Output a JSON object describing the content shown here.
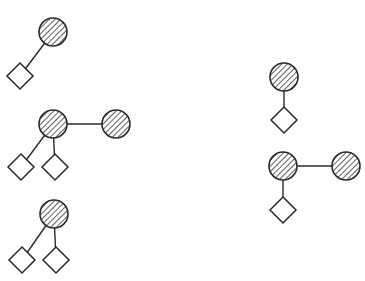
{
  "diagram": {
    "width": 365,
    "height": 281,
    "colors": {
      "stroke": "#2a2a2a",
      "background": "#ffffff",
      "diamond_fill": "#ffffff"
    },
    "node_styles": {
      "circle": {
        "shape": "circle",
        "fill": "hatched",
        "radius": 14
      },
      "diamond": {
        "shape": "diamond",
        "fill": "open",
        "half_diagonal": 13
      }
    },
    "motifs": [
      {
        "id": "motif-1",
        "nodes": [
          {
            "id": "c1",
            "type": "circle",
            "x": 53,
            "y": 32
          },
          {
            "id": "d1",
            "type": "diamond",
            "x": 20,
            "y": 76
          }
        ],
        "edges": [
          [
            "c1",
            "d1"
          ]
        ]
      },
      {
        "id": "motif-2",
        "nodes": [
          {
            "id": "c2",
            "type": "circle",
            "x": 53,
            "y": 124
          },
          {
            "id": "c3",
            "type": "circle",
            "x": 116,
            "y": 124
          },
          {
            "id": "d2",
            "type": "diamond",
            "x": 21,
            "y": 167
          },
          {
            "id": "d3",
            "type": "diamond",
            "x": 55,
            "y": 167
          }
        ],
        "edges": [
          [
            "c2",
            "c3"
          ],
          [
            "c2",
            "d2"
          ],
          [
            "c2",
            "d3"
          ]
        ]
      },
      {
        "id": "motif-3",
        "nodes": [
          {
            "id": "c4",
            "type": "circle",
            "x": 54,
            "y": 214
          },
          {
            "id": "d4",
            "type": "diamond",
            "x": 22,
            "y": 260
          },
          {
            "id": "d5",
            "type": "diamond",
            "x": 56,
            "y": 260
          }
        ],
        "edges": [
          [
            "c4",
            "d4"
          ],
          [
            "c4",
            "d5"
          ]
        ]
      },
      {
        "id": "motif-4",
        "nodes": [
          {
            "id": "c5",
            "type": "circle",
            "x": 284,
            "y": 77
          },
          {
            "id": "d6",
            "type": "diamond",
            "x": 284,
            "y": 120
          }
        ],
        "edges": [
          [
            "c5",
            "d6"
          ]
        ]
      },
      {
        "id": "motif-5",
        "nodes": [
          {
            "id": "c6",
            "type": "circle",
            "x": 283,
            "y": 166
          },
          {
            "id": "c7",
            "type": "circle",
            "x": 346,
            "y": 166
          },
          {
            "id": "d7",
            "type": "diamond",
            "x": 283,
            "y": 210
          }
        ],
        "edges": [
          [
            "c6",
            "c7"
          ],
          [
            "c6",
            "d7"
          ]
        ]
      }
    ]
  }
}
